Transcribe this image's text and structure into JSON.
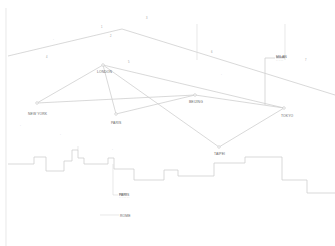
{
  "diagram": {
    "colors": {
      "line": "#cfcfcf",
      "text": "#666666",
      "background": "#ffffff"
    },
    "cities": [
      {
        "name": "LONDON",
        "x": 103,
        "y": 65
      },
      {
        "name": "NEW YORK",
        "x": 37,
        "y": 103
      },
      {
        "name": "PARIS",
        "x": 116,
        "y": 114
      },
      {
        "name": "BEIJING",
        "x": 195,
        "y": 95
      },
      {
        "name": "TOKYO",
        "x": 284,
        "y": 108
      },
      {
        "name": "TAIPEI",
        "x": 219,
        "y": 147
      }
    ],
    "callouts": [
      {
        "label": "MILAN",
        "sub": "· · · · ·",
        "x": 276,
        "y": 57
      },
      {
        "label": "PARIS",
        "sub": "· · · · · · ·",
        "x": 119,
        "y": 194
      },
      {
        "label": "ROME",
        "x": 120,
        "y": 216
      }
    ],
    "markers": [
      "1",
      "2",
      "3",
      "4",
      "5",
      "6",
      "7"
    ]
  }
}
